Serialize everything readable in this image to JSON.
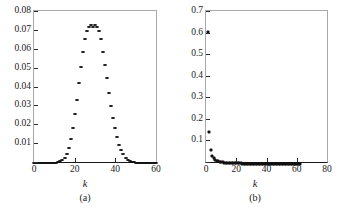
{
  "figure": {
    "background": "#ffffff",
    "marker_color": "#111111",
    "frame_color": "#a8a8a8"
  },
  "panels": [
    {
      "id": "a",
      "caption": "(a)",
      "xlabel": "k",
      "xticks": [
        "0",
        "20",
        "40",
        "60"
      ],
      "yticks": [
        "0.08",
        "0.07",
        "0.06",
        "0.05",
        "0.04",
        "0.03",
        "0.02",
        "0.01"
      ]
    },
    {
      "id": "b",
      "caption": "(b)",
      "xlabel": "k",
      "xticks": [
        "0",
        "20",
        "40",
        "60",
        "80"
      ],
      "yticks": [
        "0.7",
        "0.6",
        "0.5",
        "0.4",
        "0.3",
        "0.2",
        "0.1"
      ]
    }
  ],
  "chart_data": [
    {
      "type": "scatter",
      "panel": "(a)",
      "title": "",
      "xlabel": "k",
      "ylabel": "",
      "xlim": [
        0,
        60
      ],
      "ylim": [
        0,
        0.08
      ],
      "xticks": [
        0,
        20,
        40,
        60
      ],
      "yticks": [
        0,
        0.01,
        0.02,
        0.03,
        0.04,
        0.05,
        0.06,
        0.07,
        0.08
      ],
      "grid": false,
      "legend": null,
      "description": "Peaked bell-shaped (Poisson/binomial) degree distribution centred near k=30 with maximum about 0.073",
      "x": [
        0,
        1,
        2,
        3,
        4,
        5,
        6,
        7,
        8,
        9,
        10,
        11,
        12,
        13,
        14,
        15,
        16,
        17,
        18,
        19,
        20,
        21,
        22,
        23,
        24,
        25,
        26,
        27,
        28,
        29,
        30,
        31,
        32,
        33,
        34,
        35,
        36,
        37,
        38,
        39,
        40,
        41,
        42,
        43,
        44,
        45,
        46,
        47,
        48,
        49,
        50,
        51,
        52,
        53,
        54,
        55,
        56,
        57,
        58,
        59,
        60
      ],
      "y": [
        0.0,
        0.0,
        0.0,
        0.0,
        0.0,
        0.0,
        0.0,
        0.0,
        0.0,
        0.0,
        0.0001,
        0.0002,
        0.0004,
        0.0008,
        0.0016,
        0.0029,
        0.005,
        0.0081,
        0.0125,
        0.0185,
        0.026,
        0.0336,
        0.0425,
        0.051,
        0.059,
        0.0655,
        0.07,
        0.0722,
        0.073,
        0.0722,
        0.073,
        0.0722,
        0.07,
        0.0655,
        0.059,
        0.052,
        0.045,
        0.0372,
        0.0303,
        0.024,
        0.0184,
        0.0137,
        0.0098,
        0.0068,
        0.0046,
        0.0029,
        0.0018,
        0.0011,
        0.0006,
        0.0003,
        0.0002,
        0.0001,
        0.0001,
        0.0,
        0.0,
        0.0,
        0.0,
        0.0,
        0.0,
        0.0,
        0.0
      ]
    },
    {
      "type": "scatter",
      "panel": "(b)",
      "title": "",
      "xlabel": "k",
      "ylabel": "",
      "xlim": [
        0,
        80
      ],
      "ylim": [
        0,
        0.7
      ],
      "xticks": [
        0,
        20,
        40,
        60,
        80
      ],
      "yticks": [
        0,
        0.1,
        0.2,
        0.3,
        0.4,
        0.5,
        0.6,
        0.7
      ],
      "grid": false,
      "legend": null,
      "description": "Heavy-tailed power-law degree distribution; first point near 0.61, dropping to 0.15 then 0.065 with a long tail extending to about k=62",
      "x": [
        1,
        2,
        3,
        4,
        5,
        6,
        7,
        8,
        9,
        10,
        11,
        12,
        13,
        14,
        15,
        16,
        17,
        18,
        19,
        20,
        21,
        22,
        23,
        24,
        25,
        26,
        27,
        28,
        29,
        30,
        31,
        32,
        33,
        34,
        35,
        36,
        37,
        38,
        39,
        40,
        41,
        42,
        43,
        44,
        45,
        46,
        47,
        48,
        49,
        50,
        51,
        52,
        53,
        54,
        55,
        56,
        57,
        58,
        59,
        60,
        61,
        62
      ],
      "y": [
        0.61,
        0.15,
        0.065,
        0.038,
        0.026,
        0.019,
        0.015,
        0.012,
        0.01,
        0.0085,
        0.0074,
        0.0064,
        0.0057,
        0.0051,
        0.0046,
        0.0041,
        0.0038,
        0.0034,
        0.0032,
        0.0029,
        0.0027,
        0.0025,
        0.0024,
        0.0022,
        0.0021,
        0.002,
        0.0019,
        0.0018,
        0.0017,
        0.0016,
        0.0015,
        0.0015,
        0.0014,
        0.0013,
        0.0013,
        0.0012,
        0.0012,
        0.0011,
        0.0011,
        0.001,
        0.001,
        0.001,
        0.0009,
        0.0009,
        0.0009,
        0.0008,
        0.0008,
        0.0008,
        0.0008,
        0.0007,
        0.0007,
        0.0007,
        0.0007,
        0.0006,
        0.0006,
        0.0006,
        0.0006,
        0.0006,
        0.0005,
        0.0005,
        0.0005,
        0.0005
      ]
    }
  ]
}
